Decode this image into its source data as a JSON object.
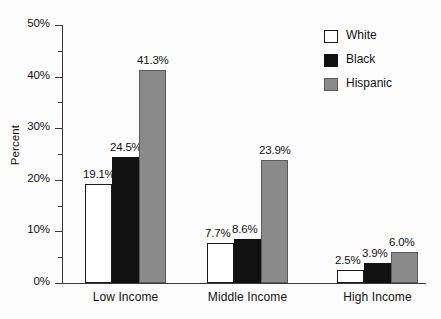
{
  "chart_data": {
    "type": "bar",
    "title": "",
    "xlabel": "",
    "ylabel": "Percent",
    "ylim": [
      0,
      50
    ],
    "ytick_labels": [
      "0%",
      "10%",
      "20%",
      "30%",
      "40%",
      "50%"
    ],
    "ytick_values": [
      0,
      10,
      20,
      30,
      40,
      50
    ],
    "yminor_values": [
      5,
      15,
      25,
      35,
      45
    ],
    "grid": false,
    "legend_position": "top-right",
    "categories": [
      "Low Income",
      "Middle Income",
      "High Income"
    ],
    "series": [
      {
        "name": "White",
        "color": "#ffffff",
        "values": [
          19.1,
          7.7,
          2.5
        ],
        "labels": [
          "19.1%",
          "7.7%",
          "2.5%"
        ]
      },
      {
        "name": "Black",
        "color": "#111111",
        "values": [
          24.5,
          8.6,
          3.9
        ],
        "labels": [
          "24.5%",
          "8.6%",
          "3.9%"
        ]
      },
      {
        "name": "Hispanic",
        "color": "#8a8a8a",
        "values": [
          41.3,
          23.9,
          6.0
        ],
        "labels": [
          "41.3%",
          "23.9%",
          "6.0%"
        ]
      }
    ]
  },
  "axis": {
    "y": {
      "ticks": [
        {
          "label": "50%",
          "value": 50
        },
        {
          "label": "40%",
          "value": 40
        },
        {
          "label": "30%",
          "value": 30
        },
        {
          "label": "20%",
          "value": 20
        },
        {
          "label": "10%",
          "value": 10
        },
        {
          "label": "0%",
          "value": 0
        }
      ],
      "title": "Percent"
    },
    "x": {
      "groups": [
        "Low Income",
        "Middle Income",
        "High Income"
      ]
    }
  },
  "legend": {
    "entries": [
      {
        "label": "White",
        "swatch": "white"
      },
      {
        "label": "Black",
        "swatch": "black"
      },
      {
        "label": "Hispanic",
        "swatch": "gray"
      }
    ]
  }
}
